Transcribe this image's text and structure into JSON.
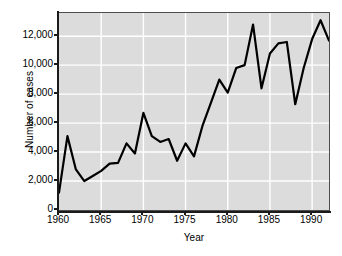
{
  "chart_data": {
    "type": "line",
    "title": "",
    "xlabel": "Year",
    "ylabel": "Number of cases",
    "xlim": [
      1960,
      1992
    ],
    "ylim": [
      0,
      13600
    ],
    "grid": true,
    "legend": null,
    "xticks": [
      1960,
      1965,
      1970,
      1975,
      1980,
      1985,
      1990
    ],
    "xticklabels": [
      "1960",
      "1965",
      "1970",
      "1975",
      "1980",
      "1985",
      "1990"
    ],
    "yticks": [
      0,
      2000,
      4000,
      6000,
      8000,
      10000,
      12000
    ],
    "yticklabels": [
      "0",
      "2,000",
      "4,000",
      "6,000",
      "8,000",
      "10,000",
      "12,000"
    ],
    "line_color": "#000000",
    "line_width": 2.2,
    "panel_color": "#dcdcdc",
    "grid_color": "#ffffff",
    "x": [
      1960,
      1961,
      1962,
      1963,
      1964,
      1965,
      1966,
      1967,
      1968,
      1969,
      1970,
      1971,
      1972,
      1973,
      1974,
      1975,
      1976,
      1977,
      1978,
      1979,
      1980,
      1981,
      1982,
      1983,
      1984,
      1985,
      1986,
      1987,
      1988,
      1989,
      1990,
      1991,
      1992
    ],
    "values": [
      1200,
      5100,
      2800,
      2000,
      2350,
      2700,
      3200,
      3250,
      4600,
      3900,
      6700,
      5100,
      4700,
      4900,
      3400,
      4600,
      3700,
      5800,
      7400,
      9000,
      8100,
      9800,
      10000,
      12800,
      8400,
      10800,
      11500,
      11600,
      7300,
      9800,
      11800,
      13100,
      11700
    ],
    "series": [
      {
        "name": "Number of cases",
        "values": [
          1200,
          5100,
          2800,
          2000,
          2350,
          2700,
          3200,
          3250,
          4600,
          3900,
          6700,
          5100,
          4700,
          4900,
          3400,
          4600,
          3700,
          5800,
          7400,
          9000,
          8100,
          9800,
          10000,
          12800,
          8400,
          10800,
          11500,
          11600,
          7300,
          9800,
          11800,
          13100,
          11700
        ]
      }
    ]
  }
}
